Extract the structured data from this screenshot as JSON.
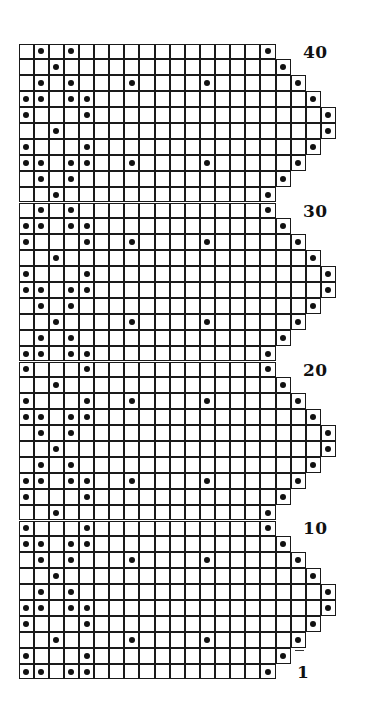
{
  "chart_data": {
    "type": "knitting-chart",
    "title": "",
    "rows_total": 40,
    "row_numbering": "bottom-to-top",
    "cell_symbol": "filled dot",
    "row_labels": [
      {
        "row": 40,
        "text": "40"
      },
      {
        "row": 30,
        "text": "30"
      },
      {
        "row": 20,
        "text": "20"
      },
      {
        "row": 10,
        "text": "10"
      },
      {
        "row": 1,
        "text": "1"
      }
    ],
    "rows": [
      {
        "row": 40,
        "width": 17,
        "dots": [
          2,
          4,
          17
        ]
      },
      {
        "row": 39,
        "width": 18,
        "dots": [
          3,
          18
        ]
      },
      {
        "row": 38,
        "width": 19,
        "dots": [
          2,
          4,
          8,
          13,
          19
        ]
      },
      {
        "row": 37,
        "width": 20,
        "dots": [
          1,
          2,
          4,
          5,
          20
        ]
      },
      {
        "row": 36,
        "width": 21,
        "dots": [
          1,
          5,
          21
        ]
      },
      {
        "row": 35,
        "width": 21,
        "dots": [
          3,
          21
        ]
      },
      {
        "row": 34,
        "width": 20,
        "dots": [
          1,
          5,
          20
        ]
      },
      {
        "row": 33,
        "width": 19,
        "dots": [
          1,
          2,
          4,
          5,
          8,
          13,
          19
        ]
      },
      {
        "row": 32,
        "width": 18,
        "dots": [
          2,
          4,
          18
        ]
      },
      {
        "row": 31,
        "width": 17,
        "dots": [
          3,
          17
        ]
      },
      {
        "row": 30,
        "width": 17,
        "dots": [
          2,
          4,
          17
        ]
      },
      {
        "row": 29,
        "width": 18,
        "dots": [
          1,
          2,
          4,
          5,
          18
        ]
      },
      {
        "row": 28,
        "width": 19,
        "dots": [
          1,
          5,
          8,
          13,
          19
        ]
      },
      {
        "row": 27,
        "width": 20,
        "dots": [
          3,
          20
        ]
      },
      {
        "row": 26,
        "width": 21,
        "dots": [
          1,
          5,
          21
        ]
      },
      {
        "row": 25,
        "width": 21,
        "dots": [
          1,
          2,
          4,
          5,
          21
        ]
      },
      {
        "row": 24,
        "width": 20,
        "dots": [
          2,
          4,
          20
        ]
      },
      {
        "row": 23,
        "width": 19,
        "dots": [
          3,
          8,
          13,
          19
        ]
      },
      {
        "row": 22,
        "width": 18,
        "dots": [
          2,
          4,
          18
        ]
      },
      {
        "row": 21,
        "width": 17,
        "dots": [
          1,
          2,
          4,
          5,
          17
        ]
      },
      {
        "row": 20,
        "width": 17,
        "dots": [
          1,
          5,
          17
        ]
      },
      {
        "row": 19,
        "width": 18,
        "dots": [
          3,
          18
        ]
      },
      {
        "row": 18,
        "width": 19,
        "dots": [
          1,
          5,
          8,
          13,
          19
        ]
      },
      {
        "row": 17,
        "width": 20,
        "dots": [
          1,
          2,
          4,
          5,
          20
        ]
      },
      {
        "row": 16,
        "width": 21,
        "dots": [
          2,
          4,
          21
        ]
      },
      {
        "row": 15,
        "width": 21,
        "dots": [
          3,
          21
        ]
      },
      {
        "row": 14,
        "width": 20,
        "dots": [
          2,
          4,
          20
        ]
      },
      {
        "row": 13,
        "width": 19,
        "dots": [
          1,
          2,
          4,
          5,
          8,
          13,
          19
        ]
      },
      {
        "row": 12,
        "width": 18,
        "dots": [
          1,
          5,
          18
        ]
      },
      {
        "row": 11,
        "width": 17,
        "dots": [
          3,
          17
        ]
      },
      {
        "row": 10,
        "width": 17,
        "dots": [
          1,
          5,
          17
        ]
      },
      {
        "row": 9,
        "width": 18,
        "dots": [
          1,
          2,
          4,
          5,
          18
        ]
      },
      {
        "row": 8,
        "width": 19,
        "dots": [
          2,
          4,
          8,
          13,
          19
        ]
      },
      {
        "row": 7,
        "width": 20,
        "dots": [
          3,
          20
        ]
      },
      {
        "row": 6,
        "width": 21,
        "dots": [
          2,
          4,
          21
        ]
      },
      {
        "row": 5,
        "width": 21,
        "dots": [
          1,
          2,
          4,
          5,
          21
        ]
      },
      {
        "row": 4,
        "width": 20,
        "dots": [
          1,
          5,
          20
        ]
      },
      {
        "row": 3,
        "width": 19,
        "dots": [
          3,
          8,
          13,
          19
        ]
      },
      {
        "row": 2,
        "width": 18,
        "dots": [
          1,
          5,
          18
        ]
      },
      {
        "row": 1,
        "width": 17,
        "dots": [
          1,
          2,
          4,
          5,
          17
        ]
      }
    ]
  },
  "labels": {
    "l40": "40",
    "l30": "30",
    "l20": "20",
    "l10": "10",
    "l1": "1"
  }
}
